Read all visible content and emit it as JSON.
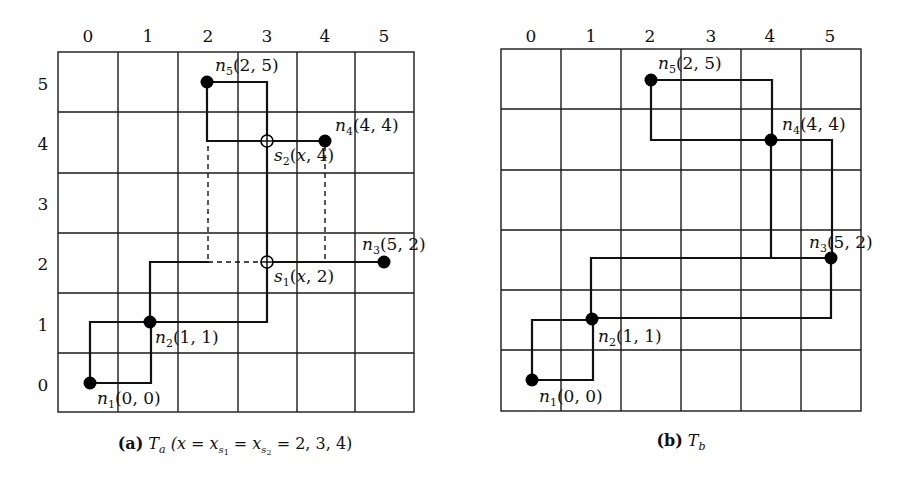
{
  "panels": [
    {
      "id": "a",
      "caption_tag": "(a)",
      "caption_tree": "T",
      "caption_tree_sub": "a",
      "caption_rest": "(x = x",
      "caption_s1": "s",
      "caption_s1_sub": "1",
      "caption_eq": " = x",
      "caption_s2": "s",
      "caption_s2_sub": "2",
      "caption_vals": " = 2, 3, 4)",
      "x_ticks": [
        "0",
        "1",
        "2",
        "3",
        "4",
        "5"
      ],
      "y_ticks": [
        "5",
        "4",
        "3",
        "2",
        "1",
        "0"
      ],
      "nodes": [
        {
          "name": "n",
          "sub": "1",
          "coord": "(0, 0)"
        },
        {
          "name": "n",
          "sub": "2",
          "coord": "(1, 1)"
        },
        {
          "name": "n",
          "sub": "3",
          "coord": "(5, 2)"
        },
        {
          "name": "n",
          "sub": "4",
          "coord": "(4, 4)"
        },
        {
          "name": "n",
          "sub": "5",
          "coord": "(2, 5)"
        }
      ],
      "steiner_points": [
        {
          "name": "s",
          "sub": "1",
          "coord_x": "x",
          "coord_y": "2"
        },
        {
          "name": "s",
          "sub": "2",
          "coord_x": "x",
          "coord_y": "4"
        }
      ]
    },
    {
      "id": "b",
      "caption_tag": "(b)",
      "caption_tree": "T",
      "caption_tree_sub": "b",
      "x_ticks": [
        "0",
        "1",
        "2",
        "3",
        "4",
        "5"
      ],
      "nodes": [
        {
          "name": "n",
          "sub": "1",
          "coord": "(0, 0)"
        },
        {
          "name": "n",
          "sub": "2",
          "coord": "(1, 1)"
        },
        {
          "name": "n",
          "sub": "3",
          "coord": "(5, 2)"
        },
        {
          "name": "n",
          "sub": "4",
          "coord": "(4, 4)"
        },
        {
          "name": "n",
          "sub": "5",
          "coord": "(2, 5)"
        }
      ]
    }
  ]
}
